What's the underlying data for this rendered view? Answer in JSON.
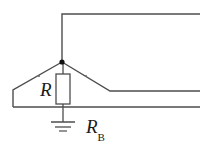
{
  "figure": {
    "kind": "electrical-circuit-schematic",
    "width": 209,
    "height": 151,
    "background_color": "#ffffff",
    "wire_color": "#4d4d4d",
    "node_color": "#111111",
    "text_color": "#1a1a1a"
  },
  "labels": {
    "resistor": "R",
    "ground_resistor_base": "R",
    "ground_resistor_subscript": "B"
  },
  "components": {
    "resistor": {
      "name": "R",
      "shape": "rectangle",
      "x": 56,
      "y": 74,
      "width": 14,
      "height": 30
    },
    "junction_node": {
      "name": "node",
      "x": 62,
      "y": 62,
      "radius": 2.6
    },
    "ground": {
      "name": "earth-ground",
      "x": 63,
      "bars": [
        {
          "y": 122,
          "half_width": 12
        },
        {
          "y": 127,
          "half_width": 8
        },
        {
          "y": 131,
          "half_width": 4
        }
      ]
    }
  },
  "wires": {
    "top_riser": "M62,62 L62,14 L200,14",
    "left_branch": "M62,62 L13,90 L13,107",
    "right_branch": "M62,62 L110,91 L200,91",
    "bottom_rail": "M13,107 L200,107",
    "resistor_top_lead": "M63,62 L63,74",
    "resistor_bottom_lead": "M63,104 L63,122"
  },
  "contact_marks": [
    {
      "x": 39,
      "y": 76
    },
    {
      "x": 86,
      "y": 76
    }
  ]
}
